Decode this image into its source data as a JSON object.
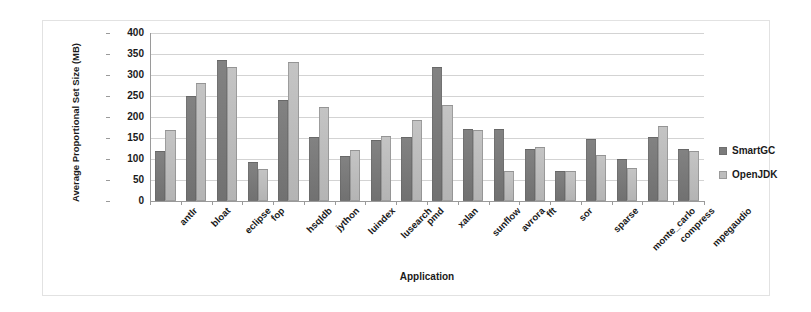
{
  "chart_data": {
    "type": "bar",
    "title": "",
    "xlabel": "Application",
    "ylabel": "Average Proportional Set Size (MB)",
    "ylim": [
      0,
      400
    ],
    "ytick_step": 50,
    "yticks": [
      400,
      350,
      300,
      250,
      200,
      150,
      100,
      50,
      0
    ],
    "grid": true,
    "legend_position": "right",
    "categories": [
      "antlr",
      "bloat",
      "eclipse",
      "fop",
      "hsqldb",
      "jython",
      "luindex",
      "lusearch",
      "pmd",
      "xalan",
      "sunflow",
      "avrora",
      "fft",
      "sor",
      "sparse",
      "monte_carlo",
      "compress",
      "mpegaudio"
    ],
    "series": [
      {
        "name": "SmartGC",
        "color": "#7b7b7b",
        "values": [
          118,
          250,
          335,
          92,
          240,
          152,
          108,
          145,
          152,
          320,
          172,
          172,
          125,
          72,
          148,
          100,
          152,
          125
        ]
      },
      {
        "name": "OpenJDK",
        "color": "#bdbdbd",
        "values": [
          170,
          280,
          320,
          77,
          330,
          225,
          122,
          155,
          192,
          228,
          170,
          72,
          128,
          72,
          110,
          78,
          178,
          118
        ]
      }
    ]
  },
  "legend": {
    "entries": [
      {
        "label": "SmartGC"
      },
      {
        "label": "OpenJDK"
      }
    ]
  }
}
